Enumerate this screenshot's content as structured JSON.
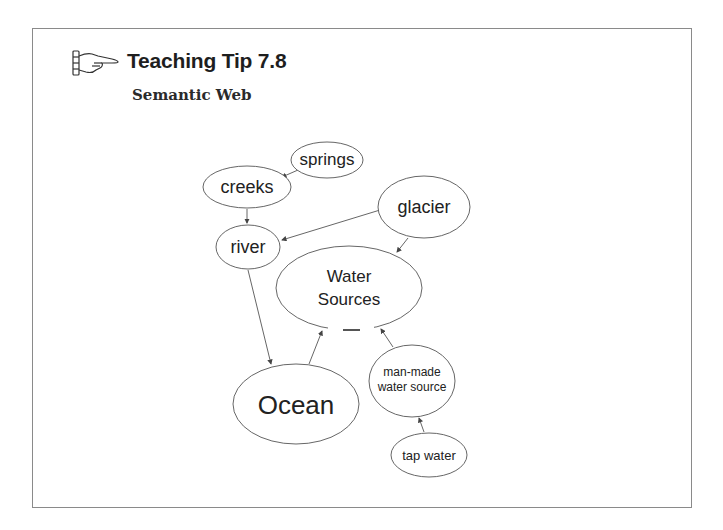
{
  "header": {
    "icon": "pointing-hand-icon",
    "title": "Teaching Tip 7.8",
    "subtitle": "Semantic Web"
  },
  "diagram": {
    "nodes": [
      {
        "id": "springs",
        "label": "springs"
      },
      {
        "id": "creeks",
        "label": "creeks"
      },
      {
        "id": "glacier",
        "label": "glacier"
      },
      {
        "id": "river",
        "label": "river"
      },
      {
        "id": "water_sources",
        "label_line1": "Water",
        "label_line2": "Sources"
      },
      {
        "id": "ocean",
        "label": "Ocean"
      },
      {
        "id": "man_made",
        "label_line1": "man-made",
        "label_line2": "water source"
      },
      {
        "id": "tap_water",
        "label": "tap water"
      }
    ],
    "edges": [
      {
        "from": "springs",
        "to": "creeks"
      },
      {
        "from": "creeks",
        "to": "river"
      },
      {
        "from": "glacier",
        "to": "river"
      },
      {
        "from": "glacier",
        "to": "water_sources"
      },
      {
        "from": "river",
        "to": "ocean"
      },
      {
        "from": "ocean",
        "to": "water_sources"
      },
      {
        "from": "man_made",
        "to": "water_sources"
      },
      {
        "from": "tap_water",
        "to": "man_made"
      }
    ],
    "colors": {
      "stroke": "#555555",
      "text": "#222222",
      "frame": "#8a8a8a"
    }
  }
}
